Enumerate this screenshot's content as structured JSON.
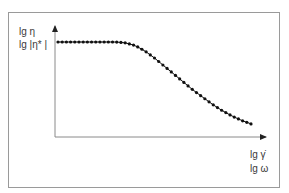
{
  "diagram": {
    "y_axis_labels": [
      "lg η",
      "lg |η* |"
    ],
    "x_axis_labels": [
      "lg γ̇",
      "lg ω"
    ],
    "colors": {
      "frame": "#9a9a9a",
      "axes": "#8a8a8a",
      "curve": "#111111",
      "text": "#3a3a3a"
    }
  },
  "chart_data": {
    "type": "line",
    "title": "",
    "xlabel": "lg γ̇ / lg ω",
    "ylabel": "lg η / lg |η*|",
    "grid": false,
    "x": [
      0,
      0.05,
      0.1,
      0.15,
      0.2,
      0.25,
      0.3,
      0.35,
      0.4,
      0.45,
      0.5,
      0.55,
      0.6,
      0.65,
      0.7,
      0.75,
      0.8,
      0.85,
      0.9,
      0.95,
      1.0
    ],
    "y": [
      1.0,
      1.0,
      1.0,
      1.0,
      1.0,
      1.0,
      1.0,
      0.99,
      0.96,
      0.9,
      0.82,
      0.73,
      0.64,
      0.55,
      0.46,
      0.38,
      0.3,
      0.23,
      0.17,
      0.12,
      0.08
    ],
    "markers": "dots"
  }
}
